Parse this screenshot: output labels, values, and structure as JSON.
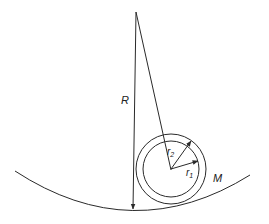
{
  "diagram": {
    "labels": {
      "R": "R",
      "r2": "r",
      "r2_sub": "2",
      "r1": "r",
      "r1_sub": "1",
      "M": "M"
    },
    "colors": {
      "stroke": "#2a2a2a",
      "background": "#ffffff"
    },
    "elements": [
      "curved-track (radius R)",
      "pivot-point",
      "vertical-radius-line R with arrow",
      "slanted line from pivot to ring center",
      "outer circle radius r2",
      "inner circle radius r1",
      "r2 arrow",
      "r1 arrow",
      "mass label M"
    ]
  }
}
